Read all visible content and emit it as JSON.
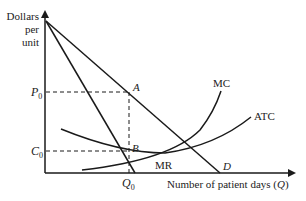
{
  "diagram": {
    "type": "economics-monopoly-hospital",
    "axes": {
      "y_label_lines": [
        "Dollars",
        "per",
        "unit"
      ],
      "x_label": "Number of patient days (",
      "x_label_var": "Q",
      "x_label_close": ")"
    },
    "curves": {
      "demand_label": "D",
      "mr_label": "MR",
      "mc_label": "MC",
      "atc_label": "ATC"
    },
    "points": {
      "a_label": "A",
      "b_label": "B"
    },
    "ticks": {
      "p0_main": "P",
      "p0_sub": "0",
      "c0_main": "C",
      "c0_sub": "0",
      "q0_main": "Q",
      "q0_sub": "0"
    },
    "colors": {
      "line": "#1a1a1a",
      "text": "#222222",
      "background": "#ffffff"
    }
  }
}
